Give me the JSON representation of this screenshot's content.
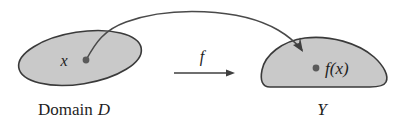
{
  "figure": {
    "background_color": "#ffffff",
    "region_fill_color": "#c9c9c9",
    "region_stroke_color": "#3a3a3a",
    "curve_color": "#4a4a4a",
    "dot_color": "#5a5a5a",
    "text_color": "#1e1e1e"
  },
  "domain_region": {
    "shape": "ellipse",
    "caption_prefix": "Domain",
    "caption_symbol": "D",
    "point_label": "x"
  },
  "codomain_region": {
    "shape": "blob",
    "caption_symbol": "Y",
    "point_label": "f(x)"
  },
  "mapping": {
    "function_label": "f",
    "arrow_style": "straight-right",
    "curve_style": "arc-with-arrowhead"
  }
}
